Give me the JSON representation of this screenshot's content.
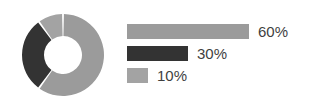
{
  "chart_data": {
    "type": "pie",
    "variant": "donut",
    "title": "",
    "subtitle": "",
    "xlabel": "",
    "ylabel": "",
    "grid": false,
    "legend_position": "right",
    "legend_style": "horizontal-bars",
    "units": "percent",
    "start_angle_deg": 0,
    "direction": "clockwise",
    "categories": [
      "60%",
      "30%",
      "10%"
    ],
    "values": [
      60,
      30,
      10
    ],
    "slices": [
      {
        "label": "60%",
        "value": 60,
        "color": "#9b9b9b",
        "sweep_deg": 216,
        "start_deg": 0,
        "end_deg": 216
      },
      {
        "label": "30%",
        "value": 30,
        "color": "#333333",
        "sweep_deg": 108,
        "start_deg": 216,
        "end_deg": 324
      },
      {
        "label": "10%",
        "value": 10,
        "color": "#a3a3a3",
        "sweep_deg": 36,
        "start_deg": 324,
        "end_deg": 360
      }
    ],
    "legend_bars": [
      {
        "label": "60%",
        "value": 60,
        "color": "#9b9b9b",
        "bar_width_px": 122
      },
      {
        "label": "30%",
        "value": 30,
        "color": "#333333",
        "bar_width_px": 61
      },
      {
        "label": "10%",
        "value": 10,
        "color": "#a3a3a3",
        "bar_width_px": 21
      }
    ],
    "annotations": []
  },
  "figure": {
    "background": "#ffffff",
    "label_color": "#3f3f3f",
    "slice_gap_color": "#ffffff"
  },
  "donut": {
    "center_x": 42,
    "center_y": 42,
    "outer_radius": 41,
    "inner_radius": 19,
    "gap_deg": 2.6
  }
}
